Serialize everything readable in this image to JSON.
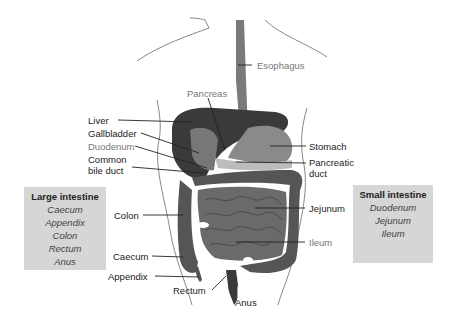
{
  "diagram": {
    "labels": {
      "esophagus": "Esophagus",
      "pancreas": "Pancreas",
      "liver": "Liver",
      "gallbladder": "Gallbladder",
      "duodenum": "Duodenum",
      "common_bile_duct_1": "Common",
      "common_bile_duct_2": "bile duct",
      "stomach": "Stomach",
      "pancreatic_duct_1": "Pancreatic",
      "pancreatic_duct_2": "duct",
      "colon": "Colon",
      "jejunum": "Jejunum",
      "ileum": "Ileum",
      "caecum": "Caecum",
      "appendix": "Appendix",
      "rectum": "Rectum",
      "anus": "Anus"
    },
    "large_intestine_box": {
      "title": "Large intestine",
      "items": [
        "Caecum",
        "Appendix",
        "Colon",
        "Rectum",
        "Anus"
      ]
    },
    "small_intestine_box": {
      "title": "Small intestine",
      "items": [
        "Duodenum",
        "Jejunum",
        "Ileum"
      ]
    },
    "colors": {
      "liver": "#3a3a3a",
      "stomach": "#8a8a8a",
      "intestine": "#6a6a6a",
      "colon": "#555555",
      "box_bg": "#d6d6d6",
      "outline": "#777777"
    }
  }
}
